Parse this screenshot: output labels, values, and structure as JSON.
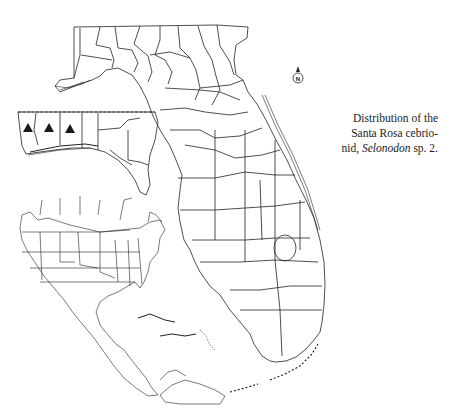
{
  "figure": {
    "caption": {
      "line1": "Distribution of the",
      "line2": "Santa Rosa cebrio-",
      "line3_prefix": "nid, ",
      "line3_italic": "Selonodon",
      "line3_suffix": " sp. 2."
    },
    "north_arrow": {
      "label": "N"
    },
    "maps": {
      "main": "Florida counties",
      "inset_panhandle": "Western Florida panhandle",
      "inset_locator": "North America and Caribbean"
    },
    "markers": {
      "symbol": "filled-triangle",
      "color": "#1a1a1a",
      "count": 3,
      "locations": [
        {
          "x": 28,
          "y": 127
        },
        {
          "x": 49,
          "y": 127
        },
        {
          "x": 70,
          "y": 128
        }
      ]
    },
    "colors": {
      "line": "#222222",
      "background": "#ffffff"
    }
  }
}
